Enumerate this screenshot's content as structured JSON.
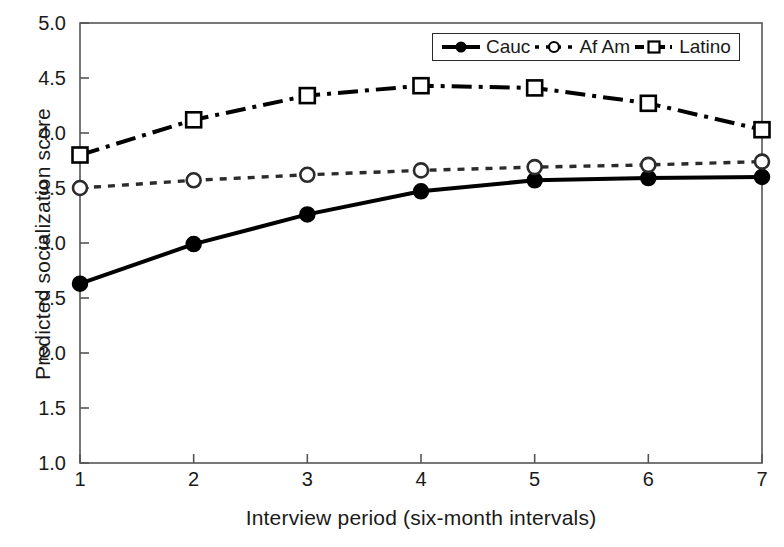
{
  "chart_data": {
    "type": "line",
    "title": "",
    "xlabel": "Interview period (six-month intervals)",
    "ylabel": "Predicted socialization score",
    "x": [
      1,
      2,
      3,
      4,
      5,
      6,
      7
    ],
    "xlim": [
      1,
      7
    ],
    "ylim": [
      1.0,
      5.0
    ],
    "xticks": [
      "1",
      "2",
      "3",
      "4",
      "5",
      "6",
      "7"
    ],
    "yticks": [
      "1.0",
      "1.5",
      "2.0",
      "2.5",
      "3.0",
      "3.5",
      "4.0",
      "4.5",
      "5.0"
    ],
    "grid": false,
    "legend_position": "top-right",
    "series": [
      {
        "name": "Cauc",
        "values": [
          2.63,
          2.99,
          3.26,
          3.47,
          3.57,
          3.59,
          3.6
        ],
        "marker": "filled-circle",
        "linestyle": "solid",
        "color": "#000000"
      },
      {
        "name": "Af Am",
        "values": [
          3.5,
          3.57,
          3.62,
          3.66,
          3.69,
          3.71,
          3.74
        ],
        "marker": "open-circle",
        "linestyle": "dotted",
        "color": "#2b2b2b"
      },
      {
        "name": "Latino",
        "values": [
          3.8,
          4.12,
          4.34,
          4.43,
          4.41,
          4.27,
          4.03
        ],
        "marker": "open-square",
        "linestyle": "dash-dot",
        "color": "#000000"
      }
    ]
  },
  "axes": {
    "frame_color": "#555555",
    "tick_color": "#555555"
  },
  "legend": {
    "entries": [
      {
        "label": "Cauc",
        "marker": "filled-circle",
        "linestyle": "solid"
      },
      {
        "label": "Af Am",
        "marker": "open-circle",
        "linestyle": "dotted"
      },
      {
        "label": "Latino",
        "marker": "open-square",
        "linestyle": "dash-dot"
      }
    ]
  }
}
